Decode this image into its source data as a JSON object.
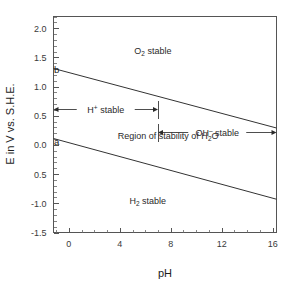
{
  "chart_data": {
    "type": "line",
    "title": "",
    "xlabel": "pH",
    "ylabel": "E in V vs. S.H.E.",
    "xlim": [
      -1.2,
      16.3
    ],
    "ylim": [
      -1.5,
      2.2
    ],
    "grid": false,
    "legend_position": "none",
    "x_ticks": [
      0,
      4,
      8,
      12,
      16
    ],
    "x_tick_labels": [
      "0",
      "4",
      "8",
      "12",
      "16"
    ],
    "x_minor_step": 1,
    "y_ticks": [
      2.0,
      1.5,
      1.0,
      0.5,
      0.0,
      -0.5,
      -1.0,
      -1.5
    ],
    "y_tick_labels": [
      "2.0",
      "1.5",
      "1.0",
      "0.5",
      "0.0",
      "0.5",
      "-1.0",
      "-1.5"
    ],
    "y_minor_step": 0.1,
    "series": [
      {
        "name": "b",
        "description": "O2 / H2O equilibrium line",
        "x": [
          -1.2,
          16.3
        ],
        "y": [
          1.31,
          0.29
        ],
        "slope": -0.059,
        "intercept": 1.23
      },
      {
        "name": "a",
        "description": "H2O / H2 equilibrium line",
        "x": [
          -1.2,
          16.3
        ],
        "y": [
          0.11,
          -0.93
        ],
        "slope": -0.059,
        "intercept": 0.0
      }
    ],
    "curve_labels": [
      {
        "text": "b",
        "x": -0.95,
        "y": 1.3
      },
      {
        "text": "a",
        "x": -0.95,
        "y": 0.06
      }
    ],
    "annotations": [
      {
        "id": "o2-stable",
        "text_parts": [
          "O",
          "2",
          " stable"
        ],
        "x": 6.6,
        "y": 1.62
      },
      {
        "id": "h2o-region",
        "text_parts": [
          "Region of stability of H",
          "2",
          "O"
        ],
        "x": 7.8,
        "y": 0.17
      },
      {
        "id": "h2-stable",
        "text_parts": [
          "H",
          "2",
          " stable"
        ],
        "x": 6.2,
        "y": -0.95
      }
    ],
    "range_arrows": [
      {
        "id": "h-plus-stable",
        "label_parts": [
          "H",
          "+",
          " stable"
        ],
        "x_start": -1.2,
        "x_end": 7.0,
        "y": 0.62,
        "end_cap": "bar"
      },
      {
        "id": "oh-minus-stable",
        "label_parts": [
          "OH",
          "–",
          " stable"
        ],
        "x_start": 7.0,
        "x_end": 16.3,
        "y": 0.23,
        "end_cap": "bar"
      }
    ],
    "colors": {
      "line": "#333333",
      "frame": "#555555",
      "text": "#1c1c1c",
      "background": "#ffffff"
    }
  }
}
